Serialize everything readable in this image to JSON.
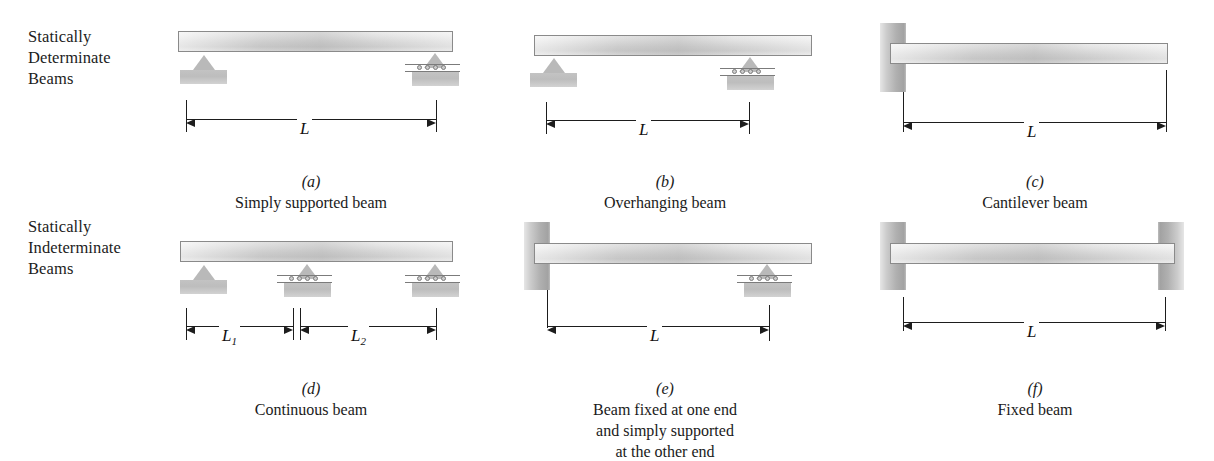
{
  "figure": {
    "row_labels": [
      {
        "id": "statically-determinate",
        "text": "Statically\nDeterminate\nBeams"
      },
      {
        "id": "statically-indeterminate",
        "text": "Statically\nIndeterminate\nBeams"
      }
    ],
    "panels": [
      {
        "key": "a",
        "letter": "(a)",
        "caption": "Simply supported beam",
        "dimensions": [
          {
            "label": "L",
            "subscript": ""
          }
        ],
        "supports": [
          "pin",
          "roller"
        ]
      },
      {
        "key": "b",
        "letter": "(b)",
        "caption": "Overhanging beam",
        "dimensions": [
          {
            "label": "L",
            "subscript": ""
          }
        ],
        "supports": [
          "pin",
          "roller"
        ]
      },
      {
        "key": "c",
        "letter": "(c)",
        "caption": "Cantilever beam",
        "dimensions": [
          {
            "label": "L",
            "subscript": ""
          }
        ],
        "supports": [
          "fixed-wall"
        ]
      },
      {
        "key": "d",
        "letter": "(d)",
        "caption": "Continuous beam",
        "dimensions": [
          {
            "label": "L",
            "subscript": "1"
          },
          {
            "label": "L",
            "subscript": "2"
          }
        ],
        "supports": [
          "pin",
          "roller",
          "roller"
        ]
      },
      {
        "key": "e",
        "letter": "(e)",
        "caption": "Beam fixed at one end\nand simply supported\nat the other end",
        "dimensions": [
          {
            "label": "L",
            "subscript": ""
          }
        ],
        "supports": [
          "fixed-wall",
          "roller"
        ]
      },
      {
        "key": "f",
        "letter": "(f)",
        "caption": "Fixed beam",
        "dimensions": [
          {
            "label": "L",
            "subscript": ""
          }
        ],
        "supports": [
          "fixed-wall",
          "fixed-wall"
        ]
      }
    ],
    "colors": {
      "beam_light": "#efefef",
      "beam_mid": "#d2d2d2",
      "beam_border": "#8a8a8a",
      "wall_dark": "#9d9d9d",
      "support_fill": "#bdbdbd",
      "line": "#1d1d1d",
      "text": "#1a1a1a",
      "background": "#ffffff"
    }
  }
}
